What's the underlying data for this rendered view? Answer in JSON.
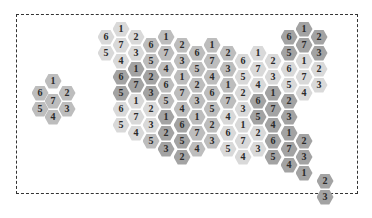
{
  "diagram": {
    "title": "",
    "colors": {
      "light": "#d9d9d9",
      "mid": "#bdbdbd",
      "dark": "#a3a3a3",
      "border": "#333333"
    },
    "legend_cluster": [
      {
        "x": 53,
        "y": 81,
        "label": "1",
        "shade": "mid"
      },
      {
        "x": 40,
        "y": 93,
        "label": "6",
        "shade": "mid"
      },
      {
        "x": 67,
        "y": 93,
        "label": "2",
        "shade": "mid"
      },
      {
        "x": 53,
        "y": 101,
        "label": "7",
        "shade": "mid"
      },
      {
        "x": 40,
        "y": 109,
        "label": "5",
        "shade": "mid"
      },
      {
        "x": 67,
        "y": 109,
        "label": "3",
        "shade": "mid"
      },
      {
        "x": 53,
        "y": 117,
        "label": "4",
        "shade": "mid"
      }
    ],
    "hexes": [
      {
        "x": 106,
        "y": 37,
        "label": "6",
        "shade": "light"
      },
      {
        "x": 106,
        "y": 53,
        "label": "5",
        "shade": "light"
      },
      {
        "x": 121,
        "y": 29,
        "label": "1",
        "shade": "light"
      },
      {
        "x": 121,
        "y": 45,
        "label": "7",
        "shade": "light"
      },
      {
        "x": 121,
        "y": 61,
        "label": "4",
        "shade": "light"
      },
      {
        "x": 121,
        "y": 77,
        "label": "6",
        "shade": "dark"
      },
      {
        "x": 121,
        "y": 93,
        "label": "5",
        "shade": "dark"
      },
      {
        "x": 121,
        "y": 109,
        "label": "6",
        "shade": "light"
      },
      {
        "x": 121,
        "y": 125,
        "label": "5",
        "shade": "light"
      },
      {
        "x": 136,
        "y": 37,
        "label": "2",
        "shade": "light"
      },
      {
        "x": 136,
        "y": 53,
        "label": "3",
        "shade": "light"
      },
      {
        "x": 136,
        "y": 69,
        "label": "1",
        "shade": "dark"
      },
      {
        "x": 136,
        "y": 85,
        "label": "7",
        "shade": "dark"
      },
      {
        "x": 136,
        "y": 101,
        "label": "1",
        "shade": "light"
      },
      {
        "x": 136,
        "y": 117,
        "label": "7",
        "shade": "light"
      },
      {
        "x": 136,
        "y": 133,
        "label": "4",
        "shade": "light"
      },
      {
        "x": 151,
        "y": 45,
        "label": "6",
        "shade": "mid"
      },
      {
        "x": 151,
        "y": 61,
        "label": "5",
        "shade": "mid"
      },
      {
        "x": 151,
        "y": 77,
        "label": "2",
        "shade": "dark"
      },
      {
        "x": 151,
        "y": 93,
        "label": "3",
        "shade": "dark"
      },
      {
        "x": 151,
        "y": 109,
        "label": "2",
        "shade": "light"
      },
      {
        "x": 151,
        "y": 125,
        "label": "3",
        "shade": "light"
      },
      {
        "x": 151,
        "y": 141,
        "label": "5",
        "shade": "mid"
      },
      {
        "x": 166,
        "y": 37,
        "label": "1",
        "shade": "mid"
      },
      {
        "x": 166,
        "y": 53,
        "label": "7",
        "shade": "mid"
      },
      {
        "x": 166,
        "y": 69,
        "label": "4",
        "shade": "mid"
      },
      {
        "x": 166,
        "y": 85,
        "label": "6",
        "shade": "mid"
      },
      {
        "x": 166,
        "y": 101,
        "label": "5",
        "shade": "mid"
      },
      {
        "x": 166,
        "y": 117,
        "label": "1",
        "shade": "dark"
      },
      {
        "x": 166,
        "y": 133,
        "label": "2",
        "shade": "dark"
      },
      {
        "x": 166,
        "y": 149,
        "label": "3",
        "shade": "dark"
      },
      {
        "x": 182,
        "y": 45,
        "label": "2",
        "shade": "mid"
      },
      {
        "x": 182,
        "y": 61,
        "label": "3",
        "shade": "mid"
      },
      {
        "x": 182,
        "y": 77,
        "label": "1",
        "shade": "mid"
      },
      {
        "x": 182,
        "y": 93,
        "label": "7",
        "shade": "mid"
      },
      {
        "x": 182,
        "y": 109,
        "label": "4",
        "shade": "mid"
      },
      {
        "x": 182,
        "y": 125,
        "label": "6",
        "shade": "dark"
      },
      {
        "x": 182,
        "y": 141,
        "label": "5",
        "shade": "dark"
      },
      {
        "x": 182,
        "y": 157,
        "label": "2",
        "shade": "dark"
      },
      {
        "x": 197,
        "y": 53,
        "label": "6",
        "shade": "mid"
      },
      {
        "x": 197,
        "y": 69,
        "label": "5",
        "shade": "mid"
      },
      {
        "x": 197,
        "y": 85,
        "label": "2",
        "shade": "mid"
      },
      {
        "x": 197,
        "y": 101,
        "label": "3",
        "shade": "mid"
      },
      {
        "x": 197,
        "y": 117,
        "label": "1",
        "shade": "mid"
      },
      {
        "x": 197,
        "y": 133,
        "label": "7",
        "shade": "mid"
      },
      {
        "x": 197,
        "y": 149,
        "label": "4",
        "shade": "mid"
      },
      {
        "x": 212,
        "y": 45,
        "label": "1",
        "shade": "mid"
      },
      {
        "x": 212,
        "y": 61,
        "label": "7",
        "shade": "mid"
      },
      {
        "x": 212,
        "y": 77,
        "label": "4",
        "shade": "mid"
      },
      {
        "x": 212,
        "y": 93,
        "label": "6",
        "shade": "mid"
      },
      {
        "x": 212,
        "y": 109,
        "label": "5",
        "shade": "mid"
      },
      {
        "x": 212,
        "y": 125,
        "label": "2",
        "shade": "mid"
      },
      {
        "x": 212,
        "y": 141,
        "label": "3",
        "shade": "mid"
      },
      {
        "x": 228,
        "y": 53,
        "label": "2",
        "shade": "mid"
      },
      {
        "x": 228,
        "y": 69,
        "label": "3",
        "shade": "mid"
      },
      {
        "x": 228,
        "y": 85,
        "label": "1",
        "shade": "mid"
      },
      {
        "x": 228,
        "y": 101,
        "label": "7",
        "shade": "mid"
      },
      {
        "x": 228,
        "y": 117,
        "label": "4",
        "shade": "light"
      },
      {
        "x": 228,
        "y": 133,
        "label": "6",
        "shade": "light"
      },
      {
        "x": 228,
        "y": 149,
        "label": "5",
        "shade": "light"
      },
      {
        "x": 243,
        "y": 61,
        "label": "6",
        "shade": "light"
      },
      {
        "x": 243,
        "y": 77,
        "label": "5",
        "shade": "light"
      },
      {
        "x": 243,
        "y": 93,
        "label": "2",
        "shade": "light"
      },
      {
        "x": 243,
        "y": 109,
        "label": "3",
        "shade": "light"
      },
      {
        "x": 243,
        "y": 125,
        "label": "1",
        "shade": "light"
      },
      {
        "x": 243,
        "y": 141,
        "label": "7",
        "shade": "light"
      },
      {
        "x": 243,
        "y": 157,
        "label": "4",
        "shade": "light"
      },
      {
        "x": 258,
        "y": 53,
        "label": "1",
        "shade": "light"
      },
      {
        "x": 258,
        "y": 69,
        "label": "7",
        "shade": "light"
      },
      {
        "x": 258,
        "y": 85,
        "label": "4",
        "shade": "light"
      },
      {
        "x": 258,
        "y": 101,
        "label": "6",
        "shade": "dark"
      },
      {
        "x": 258,
        "y": 117,
        "label": "5",
        "shade": "dark"
      },
      {
        "x": 258,
        "y": 133,
        "label": "2",
        "shade": "light"
      },
      {
        "x": 258,
        "y": 149,
        "label": "3",
        "shade": "light"
      },
      {
        "x": 273,
        "y": 61,
        "label": "2",
        "shade": "light"
      },
      {
        "x": 273,
        "y": 77,
        "label": "3",
        "shade": "light"
      },
      {
        "x": 273,
        "y": 93,
        "label": "1",
        "shade": "dark"
      },
      {
        "x": 273,
        "y": 109,
        "label": "7",
        "shade": "dark"
      },
      {
        "x": 273,
        "y": 125,
        "label": "4",
        "shade": "dark"
      },
      {
        "x": 273,
        "y": 141,
        "label": "6",
        "shade": "dark"
      },
      {
        "x": 273,
        "y": 157,
        "label": "5",
        "shade": "dark"
      },
      {
        "x": 289,
        "y": 37,
        "label": "6",
        "shade": "dark"
      },
      {
        "x": 289,
        "y": 53,
        "label": "5",
        "shade": "dark"
      },
      {
        "x": 289,
        "y": 69,
        "label": "6",
        "shade": "light"
      },
      {
        "x": 289,
        "y": 85,
        "label": "5",
        "shade": "light"
      },
      {
        "x": 289,
        "y": 101,
        "label": "2",
        "shade": "dark"
      },
      {
        "x": 289,
        "y": 117,
        "label": "3",
        "shade": "dark"
      },
      {
        "x": 289,
        "y": 133,
        "label": "1",
        "shade": "dark"
      },
      {
        "x": 289,
        "y": 149,
        "label": "7",
        "shade": "dark"
      },
      {
        "x": 289,
        "y": 165,
        "label": "4",
        "shade": "dark"
      },
      {
        "x": 304,
        "y": 29,
        "label": "1",
        "shade": "dark"
      },
      {
        "x": 304,
        "y": 45,
        "label": "7",
        "shade": "dark"
      },
      {
        "x": 304,
        "y": 61,
        "label": "1",
        "shade": "light"
      },
      {
        "x": 304,
        "y": 77,
        "label": "7",
        "shade": "light"
      },
      {
        "x": 304,
        "y": 93,
        "label": "4",
        "shade": "light"
      },
      {
        "x": 304,
        "y": 141,
        "label": "2",
        "shade": "dark"
      },
      {
        "x": 304,
        "y": 157,
        "label": "3",
        "shade": "dark"
      },
      {
        "x": 304,
        "y": 173,
        "label": "1",
        "shade": "dark"
      },
      {
        "x": 319,
        "y": 37,
        "label": "2",
        "shade": "dark"
      },
      {
        "x": 319,
        "y": 53,
        "label": "3",
        "shade": "dark"
      },
      {
        "x": 319,
        "y": 69,
        "label": "2",
        "shade": "light"
      },
      {
        "x": 319,
        "y": 85,
        "label": "3",
        "shade": "light"
      },
      {
        "x": 325,
        "y": 181,
        "label": "2",
        "shade": "dark"
      },
      {
        "x": 325,
        "y": 197,
        "label": "3",
        "shade": "dark"
      }
    ]
  }
}
